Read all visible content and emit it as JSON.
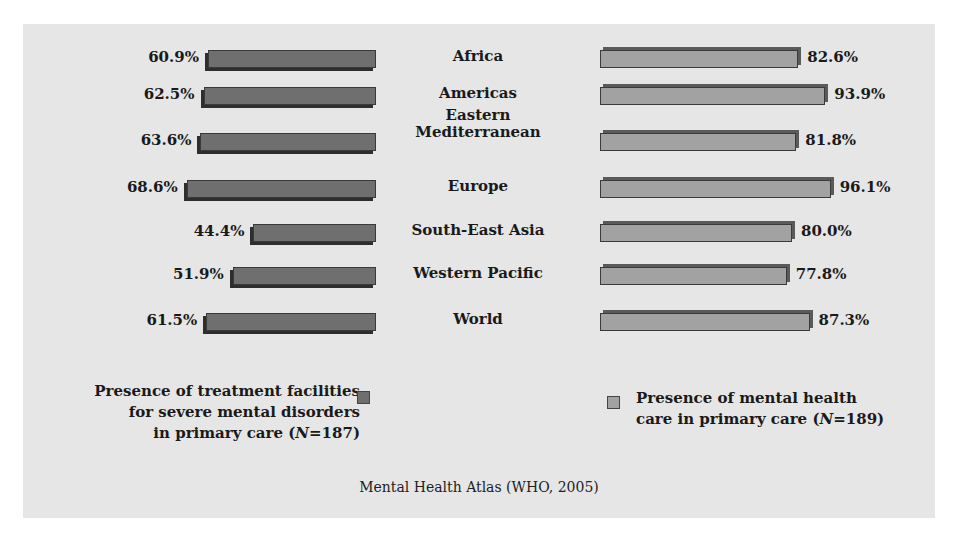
{
  "chart_data": {
    "type": "bar",
    "orientation": "horizontal-butterfly",
    "categories": [
      "Africa",
      "Americas",
      "Eastern Mediterranean",
      "Europe",
      "South-East Asia",
      "Western Pacific",
      "World"
    ],
    "series": [
      {
        "name": "Presence of treatment facilities for severe mental disorders in primary care (N=187)",
        "side": "left",
        "color": "#6f6f6f",
        "values": [
          60.9,
          62.5,
          63.6,
          68.6,
          44.4,
          51.9,
          61.5
        ],
        "labels": [
          "60.9%",
          "62.5%",
          "63.6%",
          "68.6%",
          "44.4%",
          "51.9%",
          "61.5%"
        ]
      },
      {
        "name": "Presence of mental health care in primary care (N=189)",
        "side": "right",
        "color": "#a2a2a2",
        "values": [
          82.6,
          93.9,
          81.8,
          96.1,
          80.0,
          77.8,
          87.3
        ],
        "labels": [
          "82.6%",
          "93.9%",
          "81.8%",
          "96.1%",
          "80.0%",
          "77.8%",
          "87.3%"
        ]
      }
    ],
    "title": "",
    "xlabel": "",
    "ylabel": "",
    "unit": "%",
    "grid": false,
    "legend_position": "bottom",
    "source": "Mental Health Atlas (WHO, 2005)"
  },
  "categories": [
    {
      "line1": "Africa",
      "line2": ""
    },
    {
      "line1": "Americas",
      "line2": ""
    },
    {
      "line1": "Eastern",
      "line2": "Mediterranean"
    },
    {
      "line1": "Europe",
      "line2": ""
    },
    {
      "line1": "South-East Asia",
      "line2": ""
    },
    {
      "line1": "Western Pacific",
      "line2": ""
    },
    {
      "line1": "World",
      "line2": ""
    }
  ],
  "left_labels": [
    "60.9%",
    "62.5%",
    "63.6%",
    "68.6%",
    "44.4%",
    "51.9%",
    "61.5%"
  ],
  "right_labels": [
    "82.6%",
    "93.9%",
    "81.8%",
    "96.1%",
    "80.0%",
    "77.8%",
    "87.3%"
  ],
  "legend": {
    "left": {
      "line1": "Presence of treatment facilities",
      "line2": "for severe mental disorders",
      "line3_pre": "in primary care (",
      "line3_n": "N",
      "line3_post": "=187)"
    },
    "right": {
      "line1": "Presence of mental health",
      "line2_pre": "care in primary care (",
      "line2_n": "N",
      "line2_post": "=189)"
    }
  },
  "source": "Mental Health Atlas (WHO, 2005)"
}
